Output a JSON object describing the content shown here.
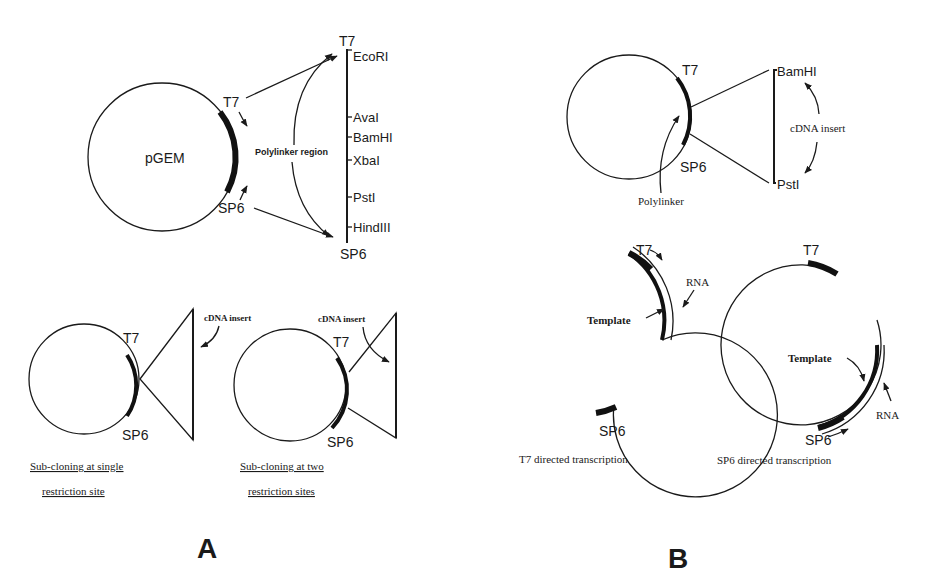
{
  "panel_a": {
    "label": "A",
    "pgem": {
      "plasmid_name": "pGEM",
      "t7": "T7",
      "sp6": "SP6",
      "polylinker_label": "Polylinker region",
      "linker_top": "T7",
      "linker_bottom": "SP6",
      "sites": [
        "EcoRI",
        "AvaI",
        "BamHI",
        "XbaI",
        "PstI",
        "HindIII"
      ]
    },
    "single_site": {
      "t7": "T7",
      "sp6": "SP6",
      "insert_label": "cDNA insert",
      "caption_line1": "Sub-cloning at single",
      "caption_line2": "restriction site"
    },
    "two_sites": {
      "t7": "T7",
      "sp6": "SP6",
      "insert_label": "cDNA insert",
      "caption_line1": "Sub-cloning at two",
      "caption_line2": "restriction sites"
    }
  },
  "panel_b": {
    "label": "B",
    "insert_plasmid": {
      "t7": "T7",
      "sp6": "SP6",
      "polylinker_label": "Polylinker",
      "site_top": "BamHI",
      "site_bottom": "PstI",
      "insert_label": "cDNA insert"
    },
    "t7_transcription": {
      "t7": "T7",
      "sp6": "SP6",
      "rna": "RNA",
      "template": "Template",
      "caption": "T7 directed transcription"
    },
    "sp6_transcription": {
      "t7": "T7",
      "sp6": "SP6",
      "rna": "RNA",
      "template": "Template",
      "caption": "SP6 directed transcription"
    }
  }
}
